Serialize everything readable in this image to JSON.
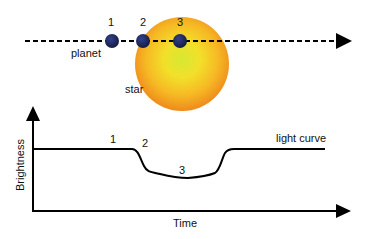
{
  "diagram": {
    "top_panel": {
      "planet_label": "planet",
      "star_label": "star",
      "positions": [
        {
          "label": "1",
          "x": 112
        },
        {
          "label": "2",
          "x": 143
        },
        {
          "label": "3",
          "x": 180
        }
      ],
      "colors": {
        "planet": "#1f2a5c",
        "star_center": "#d8e830",
        "star_mid": "#f5c41f",
        "star_edge": "#f08a1e",
        "path": "#000000"
      }
    },
    "bottom_panel": {
      "y_axis_label": "Brightness",
      "x_axis_label": "Time",
      "curve_label": "light curve",
      "point_labels": [
        "1",
        "2",
        "3"
      ]
    }
  }
}
